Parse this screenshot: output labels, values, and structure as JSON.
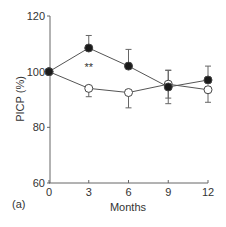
{
  "chart_data": {
    "type": "line",
    "title": "",
    "panel_label": "(a)",
    "xlabel": "Months",
    "ylabel": "PICP (%)",
    "x": [
      0,
      3,
      6,
      9,
      12
    ],
    "x_ticks": [
      "0",
      "3",
      "6",
      "9",
      "12"
    ],
    "y_ticks": [
      "60",
      "80",
      "100",
      "120"
    ],
    "xlim": [
      0,
      12
    ],
    "ylim": [
      60,
      120
    ],
    "grid": false,
    "legend": null,
    "series": [
      {
        "name": "filled circles",
        "marker": "filled-circle",
        "values": [
          100,
          108.5,
          102,
          94.5,
          97
        ],
        "error": [
          0,
          4.5,
          6,
          6,
          5
        ]
      },
      {
        "name": "open circles",
        "marker": "open-circle",
        "values": [
          100,
          94,
          92.5,
          95.5,
          93.5
        ],
        "error": [
          0,
          3,
          5.5,
          5,
          4.5
        ]
      }
    ],
    "annotations": [
      {
        "text": "**",
        "x": 3,
        "y": 101
      }
    ]
  }
}
